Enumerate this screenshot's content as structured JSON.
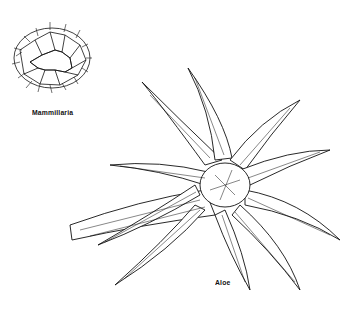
{
  "illustration": {
    "style": "black ink line drawing on white",
    "plants": [
      {
        "name": "Mammillaria",
        "label": "Mammillaria"
      },
      {
        "name": "Aloe",
        "label": "Aloe"
      }
    ]
  }
}
